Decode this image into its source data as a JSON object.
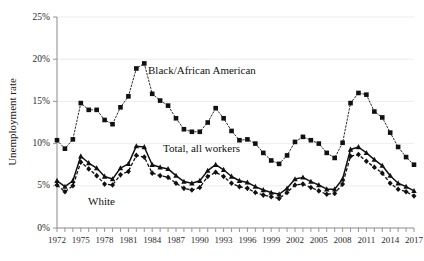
{
  "chart_data": {
    "type": "line",
    "title": "",
    "xlabel": "",
    "ylabel": "Unemployment rate",
    "xlim": [
      1972,
      2017
    ],
    "ylim": [
      0,
      25
    ],
    "y_tick_labels": [
      "0%",
      "5%",
      "10%",
      "15%",
      "20%",
      "25%"
    ],
    "y_tick_values": [
      0,
      5,
      10,
      15,
      20,
      25
    ],
    "x_tick_labels": [
      "1972",
      "1975",
      "1978",
      "1981",
      "1984",
      "1987",
      "1990",
      "1993",
      "1996",
      "1999",
      "2002",
      "2005",
      "2008",
      "2011",
      "2014",
      "2017"
    ],
    "x_tick_values": [
      1972,
      1975,
      1978,
      1981,
      1984,
      1987,
      1990,
      1993,
      1996,
      1999,
      2002,
      2005,
      2008,
      2011,
      2014,
      2017
    ],
    "x_minor_ticks_every": 1,
    "grid": "horizontal-light",
    "legend_position": "inline-annotations",
    "x": [
      1972,
      1973,
      1974,
      1975,
      1976,
      1977,
      1978,
      1979,
      1980,
      1981,
      1982,
      1983,
      1984,
      1985,
      1986,
      1987,
      1988,
      1989,
      1990,
      1991,
      1992,
      1993,
      1994,
      1995,
      1996,
      1997,
      1998,
      1999,
      2000,
      2001,
      2002,
      2003,
      2004,
      2005,
      2006,
      2007,
      2008,
      2009,
      2010,
      2011,
      2012,
      2013,
      2014,
      2015,
      2016,
      2017
    ],
    "series": [
      {
        "name": "Black/African American",
        "marker": "square",
        "line_style": "dotted",
        "values": [
          10.4,
          9.4,
          10.5,
          14.8,
          14.0,
          14.0,
          12.8,
          12.3,
          14.3,
          15.6,
          18.9,
          19.5,
          15.9,
          15.1,
          14.5,
          13.0,
          11.7,
          11.4,
          11.4,
          12.5,
          14.2,
          13.0,
          11.5,
          10.4,
          10.5,
          10.0,
          8.9,
          8.0,
          7.6,
          8.6,
          10.2,
          10.8,
          10.4,
          10.0,
          8.9,
          8.3,
          10.1,
          14.8,
          16.0,
          15.8,
          13.8,
          13.1,
          11.3,
          9.6,
          8.4,
          7.5
        ],
        "label_annotation": "Black/African American"
      },
      {
        "name": "Total, all workers",
        "marker": "triangle",
        "line_style": "solid",
        "values": [
          5.6,
          4.9,
          5.6,
          8.5,
          7.7,
          7.1,
          6.1,
          5.8,
          7.1,
          7.6,
          9.7,
          9.6,
          7.5,
          7.2,
          7.0,
          6.2,
          5.5,
          5.3,
          5.6,
          6.8,
          7.5,
          6.9,
          6.1,
          5.6,
          5.4,
          4.9,
          4.5,
          4.2,
          4.0,
          4.7,
          5.8,
          6.0,
          5.5,
          5.1,
          4.6,
          4.6,
          5.8,
          9.3,
          9.6,
          8.9,
          8.1,
          7.4,
          6.2,
          5.3,
          4.9,
          4.4
        ],
        "label_annotation": "Total, all workers"
      },
      {
        "name": "White",
        "marker": "diamond",
        "line_style": "dashed",
        "values": [
          5.1,
          4.3,
          5.0,
          7.8,
          7.0,
          6.2,
          5.2,
          5.1,
          6.3,
          6.7,
          8.6,
          8.4,
          6.5,
          6.2,
          6.0,
          5.3,
          4.7,
          4.5,
          4.8,
          6.1,
          6.6,
          6.1,
          5.3,
          4.9,
          4.7,
          4.2,
          3.9,
          3.7,
          3.5,
          4.2,
          5.1,
          5.2,
          4.8,
          4.4,
          4.0,
          4.1,
          5.2,
          8.5,
          8.7,
          7.9,
          7.2,
          6.5,
          5.3,
          4.6,
          4.3,
          3.8
        ],
        "label_annotation": "White"
      }
    ],
    "annotations": [
      {
        "text": "Black/African American",
        "x_px": 148,
        "y_px": 74
      },
      {
        "text": "Total, all workers",
        "x_px": 163,
        "y_px": 152
      },
      {
        "text": "White",
        "x_px": 88,
        "y_px": 205
      }
    ]
  }
}
